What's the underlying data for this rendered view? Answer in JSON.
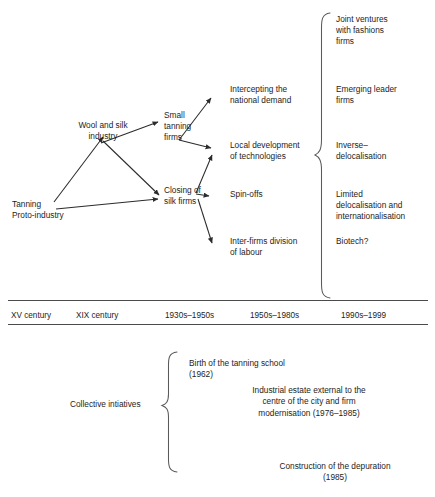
{
  "diagram": {
    "stage_nodes": [
      {
        "id": "tanning-proto-industry",
        "label": "Tanning\nProto-industry"
      },
      {
        "id": "wool-and-silk-industry",
        "label": "Wool and silk\nindustry"
      },
      {
        "id": "small-tanning-firms",
        "label": "Small\ntanning\nfirms"
      },
      {
        "id": "closing-of-silk-firms",
        "label": "Closing of\nsilk firms"
      },
      {
        "id": "intercepting-national-demand",
        "label": "Intercepting the\nnational demand"
      },
      {
        "id": "local-development-of-technologies",
        "label": "Local development\nof technologies"
      },
      {
        "id": "spin-offs",
        "label": "Spin-offs"
      },
      {
        "id": "inter-firms-division-of-labour",
        "label": "Inter-firms division\nof labour"
      }
    ],
    "outcomes": [
      {
        "id": "joint-ventures",
        "label": "Joint ventures\nwith fashions\nfirms"
      },
      {
        "id": "emerging-leader-firms",
        "label": "Emerging leader\nfirms"
      },
      {
        "id": "inverse-delocalisation",
        "label": "Inverse–\ndelocalisation"
      },
      {
        "id": "limited-delocalisation",
        "label": "Limited\ndelocalisation and\ninternationalisation"
      },
      {
        "id": "biotech",
        "label": "Biotech?"
      }
    ],
    "timeline": {
      "ticks": [
        {
          "id": "xv-century",
          "label": "XV century"
        },
        {
          "id": "xix-century",
          "label": "XIX century"
        },
        {
          "id": "1930s-1950s",
          "label": "1930s–1950s"
        },
        {
          "id": "1950s-1980s",
          "label": "1950s–1980s"
        },
        {
          "id": "1990s-1999",
          "label": "1990s–1999"
        }
      ]
    },
    "collective": {
      "label": "Collective intiatives",
      "items": [
        {
          "id": "tanning-school",
          "label": "Birth of the tanning school\n(1962)",
          "align": "left"
        },
        {
          "id": "industrial-estate",
          "label": "Industrial estate external to the\ncentre of the city and firm\nmodernisation (1976–1985)",
          "align": "center"
        },
        {
          "id": "depuration",
          "label": "Construction of the depuration\n(1985)",
          "align": "center"
        }
      ]
    },
    "colors": {
      "ink": "#1d1d1d",
      "stroke": "#3a3a3a",
      "rule": "#4a4a4a",
      "background": "#ffffff"
    }
  }
}
